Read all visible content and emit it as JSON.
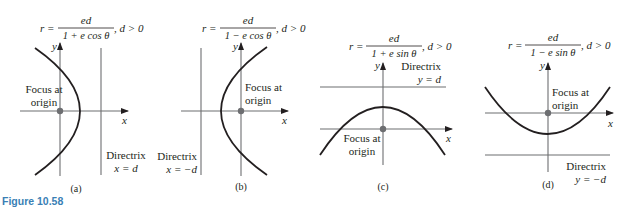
{
  "figure": {
    "caption": "Figure 10.58",
    "caption_color": "#3a7fb5",
    "panels": [
      {
        "id": "a",
        "label": "(a)",
        "formula": {
          "lhs": "r =",
          "numerator": "ed",
          "denominator": "1 + e cos θ",
          "condition": ", d > 0"
        },
        "axis_labels": {
          "x": "x",
          "y": "y"
        },
        "focus_label_line1": "Focus at",
        "focus_label_line2": "origin",
        "directrix_line1": "Directrix",
        "directrix_line2": "x = d",
        "opens": "left"
      },
      {
        "id": "b",
        "label": "(b)",
        "formula": {
          "lhs": "r =",
          "numerator": "ed",
          "denominator": "1 − e cos θ",
          "condition": ", d > 0"
        },
        "axis_labels": {
          "x": "x",
          "y": "y"
        },
        "focus_label_line1": "Focus at",
        "focus_label_line2": "origin",
        "directrix_line1": "Directrix",
        "directrix_line2": "x = −d",
        "opens": "right"
      },
      {
        "id": "c",
        "label": "(c)",
        "formula": {
          "lhs": "r =",
          "numerator": "ed",
          "denominator": "1 + e sin θ",
          "condition": ", d > 0"
        },
        "axis_labels": {
          "x": "x",
          "y": "y"
        },
        "focus_label_line1": "Focus at",
        "focus_label_line2": "origin",
        "directrix_line1": "Directrix",
        "directrix_line2": "y = d",
        "opens": "down"
      },
      {
        "id": "d",
        "label": "(d)",
        "formula": {
          "lhs": "r =",
          "numerator": "ed",
          "denominator": "1 − e sin θ",
          "condition": ", d > 0"
        },
        "axis_labels": {
          "x": "x",
          "y": "y"
        },
        "focus_label_line1": "Focus at",
        "focus_label_line2": "origin",
        "directrix_line1": "Directrix",
        "directrix_line2": "y = −d",
        "opens": "up"
      }
    ]
  }
}
